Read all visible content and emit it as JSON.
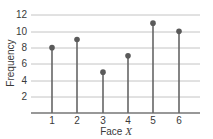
{
  "chart_data": {
    "type": "stem",
    "title": "",
    "xlabel": "Face X",
    "ylabel": "Frequency",
    "categories": [
      "1",
      "2",
      "3",
      "4",
      "5",
      "6"
    ],
    "values": [
      8,
      9,
      5,
      7,
      11,
      10
    ],
    "ylim": [
      0,
      12
    ],
    "yticks": [
      "2",
      "4",
      "6",
      "8",
      "10",
      "12"
    ],
    "grid": true,
    "legend": null
  },
  "axis": {
    "xlabel_prefix": "Face ",
    "xlabel_var": "X",
    "ylabel": "Frequency"
  },
  "colors": {
    "stem": "#666666",
    "marker": "#5a5a5a",
    "grid": "#bdbdbd",
    "axis": "#333333"
  }
}
